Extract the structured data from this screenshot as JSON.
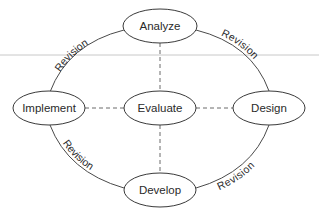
{
  "diagram": {
    "type": "cycle",
    "nodes": [
      {
        "id": "analyze",
        "label": "Analyze",
        "cx": 160,
        "cy": 26,
        "rx": 37,
        "ry": 17
      },
      {
        "id": "design",
        "label": "Design",
        "cx": 269,
        "cy": 108,
        "rx": 36,
        "ry": 17
      },
      {
        "id": "develop",
        "label": "Develop",
        "cx": 160,
        "cy": 190,
        "rx": 36,
        "ry": 17
      },
      {
        "id": "implement",
        "label": "Implement",
        "cx": 49,
        "cy": 108,
        "rx": 36,
        "ry": 17
      },
      {
        "id": "evaluate",
        "label": "Evaluate",
        "cx": 160,
        "cy": 108,
        "rx": 36,
        "ry": 17
      }
    ],
    "cycle_edges": [
      {
        "from": "analyze",
        "to": "design",
        "label": "Revision"
      },
      {
        "from": "design",
        "to": "develop",
        "label": "Revision"
      },
      {
        "from": "develop",
        "to": "implement",
        "label": "Revision"
      },
      {
        "from": "implement",
        "to": "analyze",
        "label": "Revision"
      }
    ],
    "dashed_edges": [
      {
        "from": "evaluate",
        "to": "analyze"
      },
      {
        "from": "evaluate",
        "to": "design"
      },
      {
        "from": "evaluate",
        "to": "develop"
      },
      {
        "from": "evaluate",
        "to": "implement"
      }
    ],
    "colors": {
      "stroke": "#3a3a3a",
      "dashed": "#6a6a6a",
      "text": "#2a2a2a",
      "guide_line": "#c8c8c8",
      "background": "#ffffff"
    }
  }
}
